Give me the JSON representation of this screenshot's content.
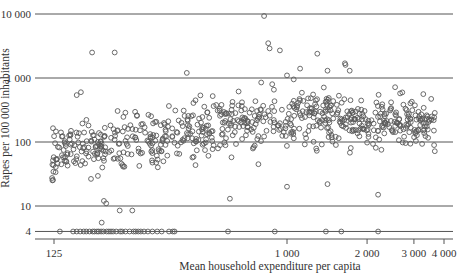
{
  "chart_data": {
    "type": "scatter",
    "title": "",
    "xlabel": "Mean household expenditure per capita",
    "ylabel": "Rapes per 100 000 inhabitants",
    "xscale": "log",
    "yscale": "log",
    "xlim": [
      110,
      4200
    ],
    "ylim": [
      3.3,
      12000
    ],
    "grid": "horizontal",
    "legend": null,
    "x_ticks": [
      125,
      1000,
      2000,
      3000,
      4000
    ],
    "x_tick_labels": [
      "125",
      "1 000",
      "2 000",
      "3 000",
      "4 000"
    ],
    "y_ticks": [
      4,
      10,
      100,
      1000,
      10000
    ],
    "y_tick_labels": [
      "4",
      "10",
      "100",
      "1 000",
      "10 000"
    ],
    "marker": "open-circle",
    "marker_color": "#555555",
    "outliers": [
      {
        "x": 820,
        "y": 9300
      },
      {
        "x": 185,
        "y": 2500
      },
      {
        "x": 225,
        "y": 2500
      },
      {
        "x": 850,
        "y": 3500
      },
      {
        "x": 860,
        "y": 2900
      },
      {
        "x": 940,
        "y": 2700
      },
      {
        "x": 1300,
        "y": 2400
      },
      {
        "x": 1650,
        "y": 1700
      },
      {
        "x": 1660,
        "y": 1600
      },
      {
        "x": 1120,
        "y": 1400
      },
      {
        "x": 1420,
        "y": 1300
      },
      {
        "x": 1720,
        "y": 1300
      },
      {
        "x": 1000,
        "y": 1100
      },
      {
        "x": 420,
        "y": 1200
      },
      {
        "x": 800,
        "y": 850
      },
      {
        "x": 1060,
        "y": 950
      },
      {
        "x": 880,
        "y": 800
      },
      {
        "x": 162,
        "y": 540
      },
      {
        "x": 168,
        "y": 600
      },
      {
        "x": 610,
        "y": 13
      },
      {
        "x": 205,
        "y": 12
      },
      {
        "x": 209,
        "y": 11
      },
      {
        "x": 235,
        "y": 8.5
      },
      {
        "x": 262,
        "y": 8.5
      },
      {
        "x": 201,
        "y": 5.5
      },
      {
        "x": 1420,
        "y": 22
      },
      {
        "x": 1000,
        "y": 20
      },
      {
        "x": 2200,
        "y": 15
      }
    ],
    "floor_points_x": [
      140,
      157,
      162,
      167,
      172,
      176,
      181,
      186,
      189,
      193,
      196,
      200,
      204,
      210,
      214,
      218,
      222,
      228,
      236,
      240,
      247,
      256,
      265,
      270,
      276,
      282,
      290,
      300,
      312,
      325,
      338,
      360,
      372,
      378,
      600,
      900,
      1400,
      1600,
      2200
    ],
    "floor_value": 4
  }
}
